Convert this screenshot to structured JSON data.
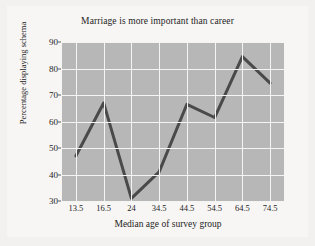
{
  "chart_data": {
    "type": "line",
    "title": "Marriage is more important than career",
    "xlabel": "Median age of survey group",
    "ylabel": "Percentage displaying schema",
    "categories": [
      "13.5",
      "16.5",
      "24",
      "34.5",
      "44.5",
      "54.5",
      "64.5",
      "74.5"
    ],
    "values": [
      47,
      67,
      31,
      41,
      66.5,
      61.5,
      84.5,
      74.5
    ],
    "ylim": [
      30,
      90
    ],
    "yticks": [
      30,
      40,
      50,
      60,
      70,
      80,
      90
    ],
    "ytick_labels": [
      "30",
      "40",
      "50",
      "60",
      "70",
      "80",
      "90"
    ],
    "grid": true,
    "legend": "none",
    "colors": {
      "line": "#4a4a4a",
      "plot_background": "#b7b7b7",
      "gridline": "#f4f4f2",
      "figure_background": "#f2f1ef",
      "text": "#1d1d1d"
    }
  }
}
